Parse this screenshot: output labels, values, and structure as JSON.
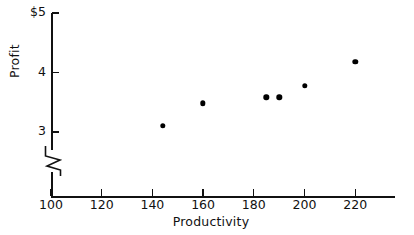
{
  "chart_data": {
    "type": "scatter",
    "title": "",
    "xlabel": "Productivity",
    "ylabel": "Profit",
    "xlim": [
      100,
      232
    ],
    "ylim": [
      3,
      5
    ],
    "grid": false,
    "legend": null,
    "y_axis_broken": true,
    "y_axis_break_note": "zigzag break below 3",
    "x_ticks": [
      100,
      120,
      140,
      160,
      180,
      200,
      220
    ],
    "x_tick_labels": [
      "100",
      "120",
      "140",
      "160",
      "180",
      "200",
      "220"
    ],
    "y_ticks": [
      3,
      4,
      5
    ],
    "y_tick_labels": [
      "3",
      "4",
      "$5"
    ],
    "points": [
      {
        "x": 144,
        "y": 3.1
      },
      {
        "x": 160,
        "y": 3.48
      },
      {
        "x": 185,
        "y": 3.58
      },
      {
        "x": 190,
        "y": 3.58
      },
      {
        "x": 200,
        "y": 3.78
      },
      {
        "x": 220,
        "y": 4.18
      }
    ]
  },
  "geometry": {
    "x_px": {
      "100": 51,
      "120": 101,
      "140": 152,
      "160": 202,
      "180": 253,
      "200": 304,
      "220": 355
    },
    "y_px": {
      "3": 132,
      "4": 73,
      "5": 13
    },
    "px_per_x_unit": 2.535,
    "px_per_y_unit": 59.5
  }
}
